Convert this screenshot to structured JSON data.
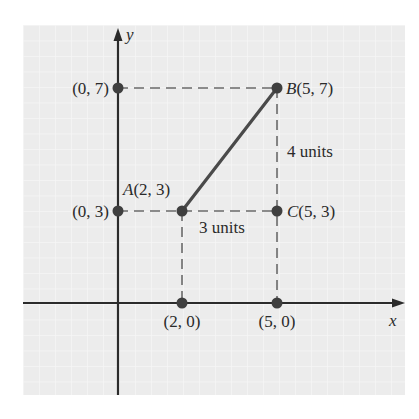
{
  "figure": {
    "type": "coordinate-plane-diagram",
    "axes": {
      "x_label": "x",
      "y_label": "y",
      "origin_px": [
        118,
        303
      ],
      "px_per_unit_x": 31.8,
      "px_per_unit_y": 30.8
    },
    "colors": {
      "background": "#ffffff",
      "grid_fill": "#ececec",
      "grid_line": "#f8f8f8",
      "axis": "#2b2b2b",
      "segment": "#4a4a4a",
      "dashed": "#6a6a6a",
      "point": "#3f3f3f",
      "text": "#2a2a2a"
    },
    "points": [
      {
        "id": "A",
        "name": "A",
        "coords": "(2, 3)",
        "x": 2,
        "y": 3
      },
      {
        "id": "B",
        "name": "B",
        "coords": "(5, 7)",
        "x": 5,
        "y": 7
      },
      {
        "id": "C",
        "name": "C",
        "coords": "(5, 3)",
        "x": 5,
        "y": 3
      },
      {
        "id": "y7",
        "name": "",
        "coords": "(0, 7)",
        "x": 0,
        "y": 7
      },
      {
        "id": "y3",
        "name": "",
        "coords": "(0, 3)",
        "x": 0,
        "y": 3
      },
      {
        "id": "x2",
        "name": "",
        "coords": "(2, 0)",
        "x": 2,
        "y": 0
      },
      {
        "id": "x5",
        "name": "",
        "coords": "(5, 0)",
        "x": 5,
        "y": 0
      }
    ],
    "segment": {
      "from": "A",
      "to": "B"
    },
    "annotations": {
      "vertical_distance": "4 units",
      "horizontal_distance": "3 units"
    },
    "labels": {
      "A_name": "A",
      "A_coords": "(2, 3)",
      "B_name": "B",
      "B_coords": "(5, 7)",
      "C_name": "C",
      "C_coords": "(5, 3)",
      "y7": "(0, 7)",
      "y3": "(0, 3)",
      "x2": "(2, 0)",
      "x5": "(5, 0)",
      "x_axis": "x",
      "y_axis": "y"
    }
  }
}
